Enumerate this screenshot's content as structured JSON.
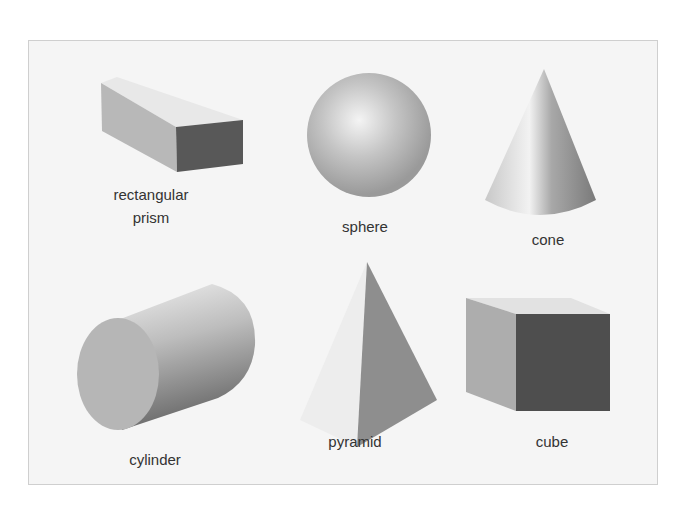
{
  "colors": {
    "background": "#ffffff",
    "panel": "#f5f5f5",
    "panel_border": "#cfcfcf",
    "light_face": "#e6e6e6",
    "mid_face": "#b4b4b4",
    "dark_face": "#595959",
    "label_text": "#333333"
  },
  "shapes": [
    {
      "id": "rectangular-prism",
      "label_line1": "rectangular",
      "label_line2": "prism"
    },
    {
      "id": "sphere",
      "label": "sphere"
    },
    {
      "id": "cone",
      "label": "cone"
    },
    {
      "id": "cylinder",
      "label": "cylinder"
    },
    {
      "id": "pyramid",
      "label": "pyramid"
    },
    {
      "id": "cube",
      "label": "cube"
    }
  ]
}
